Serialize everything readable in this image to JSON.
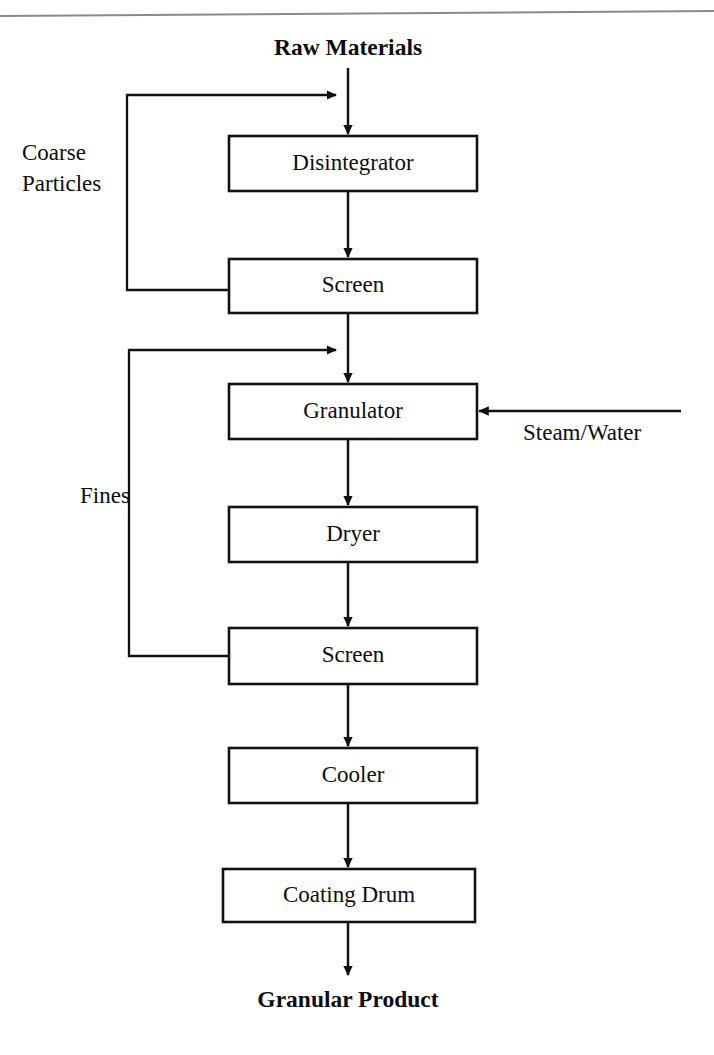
{
  "diagram": {
    "title_top": "Raw Materials",
    "title_bottom": "Granular Product",
    "colors": {
      "line": "#111111",
      "box_fill": "#ffffff",
      "box_stroke": "#111111",
      "text": "#0d0d0d",
      "scan_artifact": "#8a8a8a",
      "background": "#ffffff"
    },
    "process_boxes": [
      {
        "id": "disintegrator",
        "label": "Disintegrator",
        "x": 229,
        "y": 136,
        "w": 248,
        "h": 55
      },
      {
        "id": "screen-1",
        "label": "Screen",
        "x": 229,
        "y": 259,
        "w": 248,
        "h": 54
      },
      {
        "id": "granulator",
        "label": "Granulator",
        "x": 229,
        "y": 384,
        "w": 248,
        "h": 55
      },
      {
        "id": "dryer",
        "label": "Dryer",
        "x": 229,
        "y": 507,
        "w": 248,
        "h": 55
      },
      {
        "id": "screen-2",
        "label": "Screen",
        "x": 229,
        "y": 628,
        "w": 248,
        "h": 56
      },
      {
        "id": "cooler",
        "label": "Cooler",
        "x": 229,
        "y": 748,
        "w": 248,
        "h": 55
      },
      {
        "id": "coating-drum",
        "label": "Coating Drum",
        "x": 223,
        "y": 869,
        "w": 252,
        "h": 53
      }
    ],
    "stream_labels": [
      {
        "id": "coarse-particles",
        "lines": [
          "Coarse",
          "Particles"
        ],
        "x": 22,
        "y": 160
      },
      {
        "id": "fines",
        "lines": [
          "Fines"
        ],
        "x": 80,
        "y": 503
      },
      {
        "id": "steam-water",
        "lines": [
          "Steam/Water"
        ],
        "x": 523,
        "y": 440
      }
    ],
    "recycle_loops": [
      {
        "id": "coarse-particles-recycle",
        "from": "screen-1",
        "to": "main-feed-line",
        "label": "Coarse Particles",
        "left_x": 127,
        "top_y": 95,
        "bottom_y": 290,
        "box_left_x": 229,
        "arrow_tip_x": 347
      },
      {
        "id": "fines-recycle",
        "from": "screen-2",
        "to": "granulator-feed-line",
        "label": "Fines",
        "left_x": 129,
        "top_y": 350,
        "bottom_y": 656,
        "box_left_x": 229,
        "arrow_tip_x": 347
      }
    ],
    "feed_streams": [
      {
        "id": "steam-water-feed",
        "label": "Steam/Water",
        "target": "granulator",
        "start_x": 681,
        "end_x": 479,
        "y": 411
      }
    ],
    "main_flow": {
      "center_x": 348,
      "top_label_y": 55,
      "start_y": 68,
      "end_y": 975,
      "bottom_label_y": 1007,
      "segments": [
        {
          "from": "Raw Materials",
          "to": "Disintegrator",
          "y1": 68,
          "y2": 134
        },
        {
          "from": "Disintegrator",
          "to": "Screen",
          "y1": 191,
          "y2": 257
        },
        {
          "from": "Screen",
          "to": "Granulator",
          "y1": 313,
          "y2": 382
        },
        {
          "from": "Granulator",
          "to": "Dryer",
          "y1": 439,
          "y2": 505
        },
        {
          "from": "Dryer",
          "to": "Screen",
          "y1": 562,
          "y2": 626
        },
        {
          "from": "Screen",
          "to": "Cooler",
          "y1": 684,
          "y2": 746
        },
        {
          "from": "Cooler",
          "to": "Coating Drum",
          "y1": 803,
          "y2": 867
        },
        {
          "from": "Coating Drum",
          "to": "Granular Product",
          "y1": 922,
          "y2": 975
        }
      ]
    },
    "scan_artifact": {
      "id": "top-scan-line",
      "x1": 0,
      "y1": 16,
      "x2": 714,
      "y2": 11
    }
  }
}
